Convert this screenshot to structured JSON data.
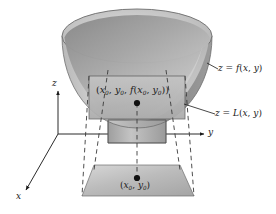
{
  "figure": {
    "background_color": "#ffffff",
    "ink_color": "#1a1a1a",
    "surface_color": "#a8a8a8",
    "surface_shadow_color": "#8a8a8a",
    "plane_color": "#b5b5b5",
    "base_color": "#bdbdbd"
  },
  "axes": {
    "z": {
      "label": "z",
      "name": "z-axis"
    },
    "y": {
      "label": "y",
      "name": "y-axis"
    },
    "x": {
      "label": "x",
      "name": "x-axis"
    }
  },
  "labels": {
    "surface_equation": {
      "lhs": "z",
      "eq": " = ",
      "fn": "f",
      "args": "(x, y)",
      "full": "z = f(x, y)"
    },
    "plane_equation": {
      "lhs": "z",
      "eq": " = ",
      "fn": "L",
      "args": "(x, y)",
      "full": "z = L(x, y)"
    },
    "tangent_point": {
      "full": "(x0, y0, f(x0, y0))"
    },
    "base_point": {
      "full": "(x0, y0)"
    }
  },
  "markers": {
    "tangent_point_dot": "filled-dot",
    "base_point_dot": "filled-dot"
  }
}
